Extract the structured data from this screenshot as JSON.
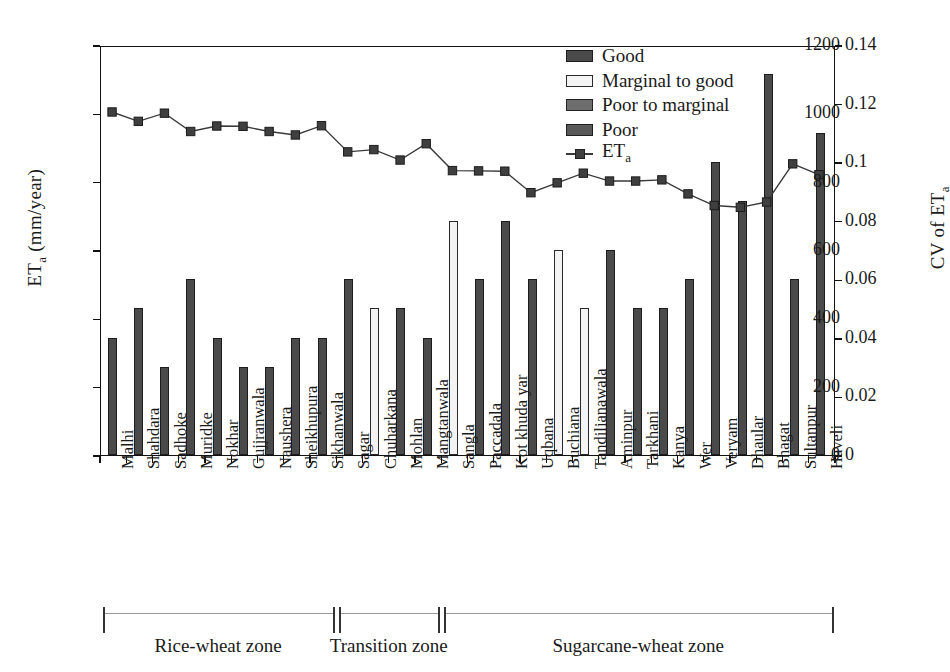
{
  "chart_data": {
    "type": "bar",
    "title": "",
    "xlabel": "",
    "ylabel": "ETa (mm/year)",
    "y2label": "CV of ETa",
    "ylim": [
      0,
      1200
    ],
    "y2lim": [
      0,
      0.14
    ],
    "yticks": [
      "0",
      "200",
      "400",
      "600",
      "800",
      "1000",
      "1200"
    ],
    "ytick_values": [
      0,
      200,
      400,
      600,
      800,
      1000,
      1200
    ],
    "y2ticks": [
      "0",
      "0.02",
      "0.04",
      "0.06",
      "0.08",
      "0.1",
      "0.12",
      "0.14"
    ],
    "y2tick_values": [
      0,
      0.02,
      0.04,
      0.06,
      0.08,
      0.1,
      0.12,
      0.14
    ],
    "grid": false,
    "legend_position": "top-center",
    "categories": [
      "Malhi",
      "Shahdara",
      "Sadhoke",
      "Muridke",
      "Nokhar",
      "Gujjranwala",
      "Naushera",
      "Sheikhupura",
      "Sikhanwala",
      "Sagar",
      "Chuharkana",
      "Mohlan",
      "Mangtanwala",
      "Sangla",
      "Paccadala",
      "Kot khuda yar",
      "Uqbana",
      "Buchiana",
      "Tandilianawala",
      "Aminpur",
      "Tarkhani",
      "Kanya",
      "Wer",
      "Veryam",
      "Dhaular",
      "Bhagat",
      "Sultanpur",
      "Haveli"
    ],
    "bar_values": [
      343,
      429,
      257,
      515,
      343,
      257,
      257,
      343,
      343,
      515,
      429,
      429,
      343,
      686,
      515,
      686,
      515,
      600,
      429,
      600,
      429,
      429,
      515,
      857,
      743,
      1114,
      515,
      943
    ],
    "bar_classes": [
      "good",
      "good",
      "good",
      "good",
      "good",
      "good",
      "good",
      "good",
      "good",
      "good",
      "m2g",
      "good",
      "good",
      "m2g",
      "good",
      "good",
      "good",
      "m2g",
      "m2g",
      "good",
      "good",
      "good",
      "good",
      "good",
      "good",
      "good",
      "good",
      "good"
    ],
    "series": [
      {
        "name": "ETa",
        "type": "line",
        "axis": "right",
        "values": [
          0.1177,
          0.1145,
          0.1173,
          0.111,
          0.1129,
          0.1128,
          0.111,
          0.1098,
          0.113,
          0.104,
          0.1048,
          0.1012,
          0.1068,
          0.0976,
          0.0975,
          0.0974,
          0.09,
          0.0934,
          0.0967,
          0.094,
          0.094,
          0.0944,
          0.0896,
          0.0856,
          0.085,
          0.0868,
          0.0999,
          0.0962
        ]
      }
    ],
    "legend": [
      {
        "label": "Good",
        "swatch": "good"
      },
      {
        "label": "Marginal to good",
        "swatch": "m2g"
      },
      {
        "label": "Poor to marginal",
        "swatch": "p2m"
      },
      {
        "label": "Poor",
        "swatch": "poor"
      },
      {
        "label": "ETa",
        "swatch": "line"
      }
    ],
    "zones": [
      {
        "label": "Rice-wheat zone",
        "start_index": 0,
        "end_index": 8
      },
      {
        "label": "Transition zone",
        "start_index": 9,
        "end_index": 12
      },
      {
        "label": "Sugarcane-wheat zone",
        "start_index": 13,
        "end_index": 27
      }
    ],
    "colors": {
      "good": "#4a4a4a",
      "marginal_to_good": "#f3f3f3",
      "poor_to_marginal": "#6e6e6e",
      "poor": "#595959",
      "line": "#3a3a3a",
      "axis": "#111111"
    }
  },
  "axis_labels": {
    "left_prefix": "ET",
    "left_sub": "a",
    "left_suffix": " (mm/year)",
    "right_prefix": "CV of ET",
    "right_sub": "a"
  },
  "legend_eta": {
    "prefix": "ET",
    "sub": "a"
  }
}
